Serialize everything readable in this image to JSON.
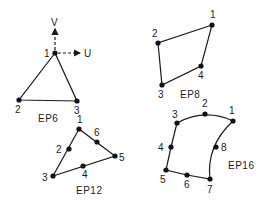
{
  "diagram": {
    "type": "finite-element-shapes",
    "colors": {
      "line": "#1a1a1a",
      "node": "#111111",
      "background": "#ffffff"
    },
    "axes": {
      "origin_element": "EP6",
      "v_label": "V",
      "u_label": "U",
      "origin_node_label": "1"
    },
    "elements": [
      {
        "name": "EP6",
        "label": "EP6",
        "label_pos": [
          48,
          121
        ],
        "edges": [
          [
            0,
            1
          ],
          [
            1,
            2
          ],
          [
            2,
            0
          ]
        ],
        "nodes": [
          {
            "label": "1",
            "x": 55,
            "y": 53,
            "lx": 44,
            "ly": 57
          },
          {
            "label": "2",
            "x": 19,
            "y": 100,
            "lx": 15,
            "ly": 113
          },
          {
            "label": "3",
            "x": 77,
            "y": 101,
            "lx": 74,
            "ly": 114
          }
        ]
      },
      {
        "name": "EP8",
        "label": "EP8",
        "label_pos": [
          181,
          98
        ],
        "edges": [
          [
            0,
            1
          ],
          [
            1,
            2
          ],
          [
            2,
            3
          ],
          [
            3,
            0
          ]
        ],
        "nodes": [
          {
            "label": "1",
            "x": 212,
            "y": 25,
            "lx": 210,
            "ly": 18
          },
          {
            "label": "2",
            "x": 158,
            "y": 43,
            "lx": 152,
            "ly": 37
          },
          {
            "label": "3",
            "x": 162,
            "y": 85,
            "lx": 158,
            "ly": 98
          },
          {
            "label": "4",
            "x": 201,
            "y": 66,
            "lx": 198,
            "ly": 79
          }
        ]
      },
      {
        "name": "EP12",
        "label": "EP12",
        "label_pos": [
          77,
          193
        ],
        "edges": [
          [
            0,
            1
          ],
          [
            1,
            2
          ],
          [
            2,
            3
          ],
          [
            3,
            4
          ],
          [
            4,
            5
          ],
          [
            5,
            0
          ]
        ],
        "nodes": [
          {
            "label": "1",
            "x": 79,
            "y": 129,
            "lx": 77,
            "ly": 123
          },
          {
            "label": "2",
            "x": 69,
            "y": 149,
            "lx": 56,
            "ly": 153
          },
          {
            "label": "3",
            "x": 53,
            "y": 176,
            "lx": 42,
            "ly": 181
          },
          {
            "label": "4",
            "x": 83,
            "y": 166,
            "lx": 82,
            "ly": 178
          },
          {
            "label": "5",
            "x": 115,
            "y": 156,
            "lx": 119,
            "ly": 161
          },
          {
            "label": "6",
            "x": 97,
            "y": 142,
            "lx": 94,
            "ly": 136
          }
        ]
      },
      {
        "name": "EP16",
        "label": "EP16",
        "label_pos": [
          229,
          169
        ],
        "nodes": [
          {
            "label": "1",
            "x": 233,
            "y": 121,
            "lx": 229,
            "ly": 114
          },
          {
            "label": "2",
            "x": 205,
            "y": 114,
            "lx": 202,
            "ly": 107
          },
          {
            "label": "3",
            "x": 177,
            "y": 123,
            "lx": 172,
            "ly": 118
          },
          {
            "label": "4",
            "x": 171,
            "y": 147,
            "lx": 158,
            "ly": 151
          },
          {
            "label": "5",
            "x": 166,
            "y": 170,
            "lx": 160,
            "ly": 183
          },
          {
            "label": "6",
            "x": 187,
            "y": 175,
            "lx": 184,
            "ly": 188
          },
          {
            "label": "7",
            "x": 210,
            "y": 179,
            "lx": 207,
            "ly": 193
          },
          {
            "label": "8",
            "x": 216,
            "y": 147,
            "lx": 221,
            "ly": 151
          }
        ]
      }
    ]
  }
}
